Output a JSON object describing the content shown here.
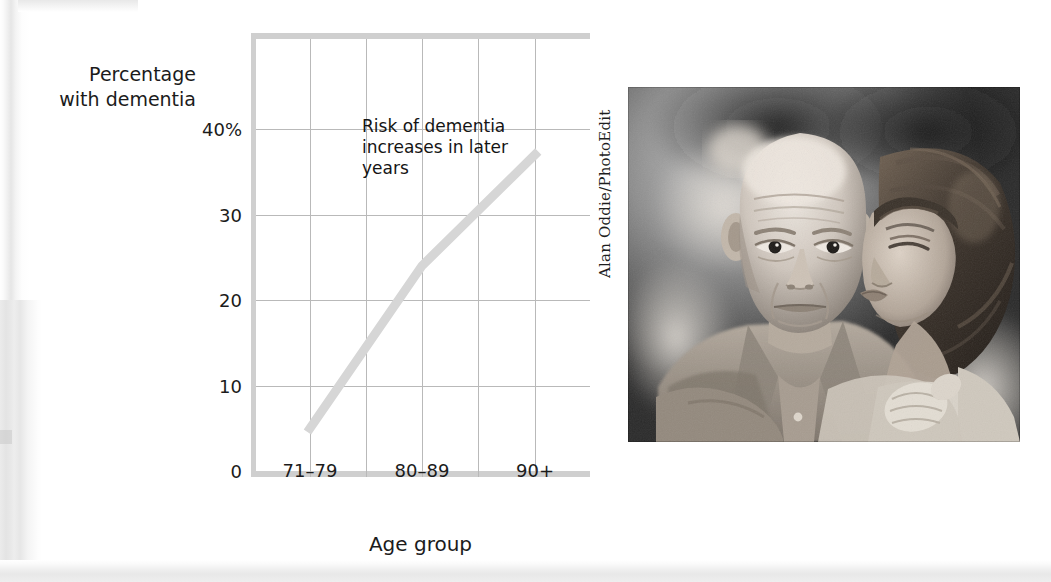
{
  "figure": {
    "y_axis_title_line1": "Percentage",
    "y_axis_title_line2": "with dementia",
    "x_axis_title": "Age group",
    "annotation_line1": "Risk of dementia",
    "annotation_line2": "increases in later",
    "annotation_line3": "years",
    "photo_credit": "Alan Oddie/PhotoEdit",
    "photo_alt": "Black and white photograph of an elderly man seated while a woman leans in and kisses his cheek",
    "line_color": "#d6d6d6",
    "grid_color": "#b9b9b9",
    "rail_color": "#cfcfcf",
    "text_color": "#1b1b1b"
  },
  "chart_data": {
    "type": "line",
    "title": "",
    "xlabel": "Age group",
    "ylabel": "Percentage with dementia",
    "categories": [
      "71–79",
      "80–89",
      "90+"
    ],
    "values": [
      5,
      24,
      37
    ],
    "series": [
      {
        "name": "Percentage with dementia",
        "values": [
          5,
          24,
          37
        ]
      }
    ],
    "ylim": [
      0,
      46
    ],
    "ytick_values": [
      0,
      10,
      20,
      30,
      40
    ],
    "ytick_labels": [
      "0",
      "10",
      "20",
      "30",
      "40%"
    ],
    "xtick_labels": [
      "71–79",
      "80–89",
      "90+"
    ],
    "grid": true,
    "legend": "none",
    "annotations": [
      {
        "text": "Risk of dementia increases in later years",
        "x": "80–89",
        "y": 42
      }
    ]
  }
}
